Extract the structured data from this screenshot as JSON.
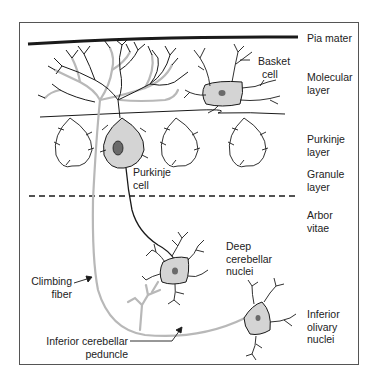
{
  "figure": {
    "colors": {
      "ink": "#1a1a1a",
      "climbing_fiber": "#b8b8b8",
      "cell_fill": "#d4d4d4",
      "nucleus": "#6a6a6a",
      "frame": "#555555"
    },
    "layer_labels": {
      "pia": "Pia mater",
      "molecular_1": "Molecular",
      "molecular_2": "layer",
      "purkinje_1": "Purkinje",
      "purkinje_2": "layer",
      "granule_1": "Granule",
      "granule_2": "layer",
      "arbor_1": "Arbor",
      "arbor_2": "vitae"
    },
    "structure_labels": {
      "basket_1": "Basket",
      "basket_2": "cell",
      "purkinje_cell_1": "Purkinje",
      "purkinje_cell_2": "cell",
      "deep_1": "Deep",
      "deep_2": "cerebellar",
      "deep_3": "nuclei",
      "climbing_1": "Climbing",
      "climbing_2": "fiber",
      "peduncle_1": "Inferior cerebellar",
      "peduncle_2": "peduncle",
      "olivary_1": "Inferior",
      "olivary_2": "olivary",
      "olivary_3": "nuclei"
    }
  }
}
